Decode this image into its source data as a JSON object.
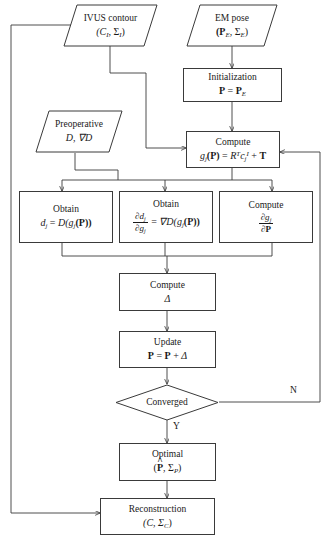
{
  "diagram": {
    "stroke_color": "#3a3a3a",
    "background": "#ffffff",
    "nodes": {
      "ivus_contour": {
        "shape": "parallelogram",
        "line1": "IVUS contour",
        "line2_main": "(C",
        "line2_sub1": "I",
        "line2_mid": ", Σ",
        "line2_sub2": "I",
        "line2_end": ")"
      },
      "em_pose": {
        "shape": "parallelogram",
        "line1": "EM pose",
        "line2_main": "(P",
        "line2_sub1": "E",
        "line2_mid": ", Σ",
        "line2_sub2": "E",
        "line2_end": ")"
      },
      "initialization": {
        "shape": "process",
        "line1": "Initialization",
        "line2_lhs": "P",
        "line2_eq": " = ",
        "line2_rhs": "P",
        "line2_sub": "E"
      },
      "preoperative": {
        "shape": "parallelogram",
        "line1": "Preoperative",
        "line2": "D, ∇D"
      },
      "compute_g": {
        "shape": "process",
        "line1": "Compute",
        "formula_lhs": "g",
        "formula_lhs_sub": "j",
        "formula_arg": "(P)",
        "formula_eq": " = ",
        "formula_R": "R",
        "formula_R_sup": "T",
        "formula_c": "c",
        "formula_c_sub": "j",
        "formula_c_sup": "I",
        "formula_plus": " + ",
        "formula_T": "T"
      },
      "obtain_d": {
        "shape": "process",
        "line1": "Obtain",
        "lhs": "d",
        "lhs_sub": "j",
        "eq": " = ",
        "rhs_D": "D(",
        "rhs_g": "g",
        "rhs_g_sub": "j",
        "rhs_P": "(P))"
      },
      "obtain_dd": {
        "shape": "process",
        "line1": "Obtain",
        "frac_num_partial": "∂d",
        "frac_num_sub": "j",
        "frac_den_partial": "∂g",
        "frac_den_sub": "j",
        "eq": " = ",
        "rhs_grad": "∇D(",
        "rhs_g": "g",
        "rhs_g_sub": "j",
        "rhs_P": "(P))"
      },
      "compute_dg": {
        "shape": "process",
        "line1": "Compute",
        "frac_num_partial": "∂g",
        "frac_num_sub": "j",
        "frac_den": "∂P"
      },
      "compute_delta": {
        "shape": "process",
        "line1": "Compute",
        "line2": "Δ"
      },
      "update": {
        "shape": "process",
        "line1": "Update",
        "line2_lhs": "P",
        "line2_eq": " = ",
        "line2_rhs": "P",
        "line2_plus": " + ",
        "line2_delta": "Δ"
      },
      "converged": {
        "shape": "decision",
        "label": "Converged"
      },
      "optimal": {
        "shape": "process",
        "line1": "Optimal",
        "line2_open": "(",
        "line2_P": "P",
        "line2_mid": ", Σ",
        "line2_sub": "P",
        "line2_close": ")"
      },
      "reconstruction": {
        "shape": "process",
        "line1": "Reconstruction",
        "line2_open": "(C, Σ",
        "line2_sub": "C",
        "line2_close": ")"
      }
    },
    "edge_labels": {
      "no_branch": "N",
      "yes_branch": "Y"
    }
  }
}
